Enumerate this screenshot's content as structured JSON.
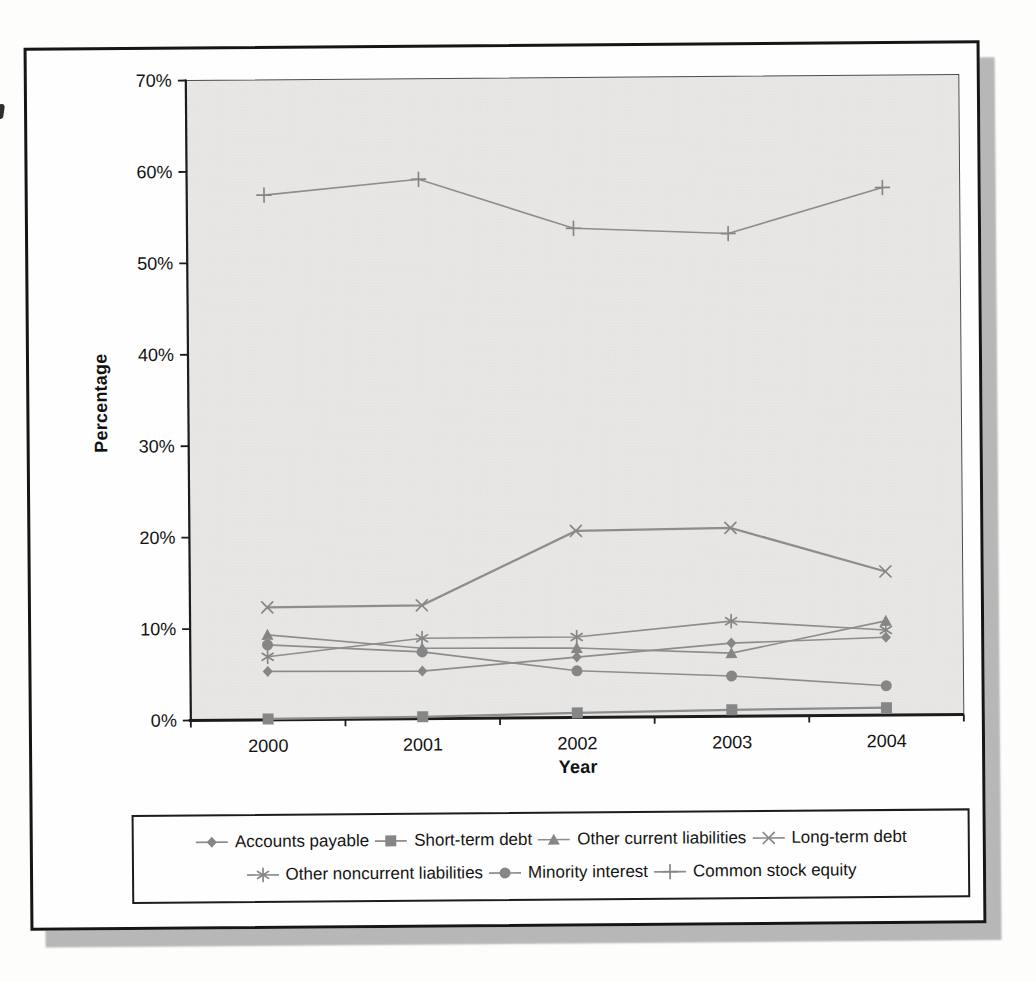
{
  "chart_data": {
    "type": "line",
    "title": "",
    "xlabel": "Year",
    "ylabel": "Percentage",
    "categories": [
      "2000",
      "2001",
      "2002",
      "2003",
      "2004"
    ],
    "ylim": [
      0,
      70
    ],
    "y_tick_step": 10,
    "y_tick_labels": [
      "0%",
      "10%",
      "20%",
      "30%",
      "40%",
      "50%",
      "60%",
      "70%"
    ],
    "grid": false,
    "legend_position": "bottom",
    "plot_fill_color": "#e8e7e5",
    "series_color": "#8d8d8d",
    "axis_color": "#1c1c1c",
    "series": [
      {
        "name": "Accounts payable",
        "marker": "diamond",
        "values": [
          5.3,
          5.2,
          6.6,
          8.0,
          8.5
        ]
      },
      {
        "name": "Short-term debt",
        "marker": "square",
        "values": [
          0.1,
          0.2,
          0.5,
          0.7,
          0.8
        ]
      },
      {
        "name": "Other current liabilities",
        "marker": "triangle",
        "values": [
          9.3,
          7.7,
          7.6,
          6.9,
          10.3
        ]
      },
      {
        "name": "Long-term debt",
        "marker": "x",
        "values": [
          12.3,
          12.4,
          20.4,
          20.6,
          15.7
        ]
      },
      {
        "name": "Other noncurrent liabilities",
        "marker": "asterisk",
        "values": [
          6.9,
          8.8,
          8.8,
          10.4,
          9.3
        ]
      },
      {
        "name": "Minority interest",
        "marker": "circle",
        "values": [
          8.2,
          7.3,
          5.1,
          4.4,
          3.2
        ]
      },
      {
        "name": "Common stock equity",
        "marker": "plus",
        "values": [
          57.4,
          59.0,
          53.5,
          52.8,
          57.7
        ]
      }
    ],
    "legend_rows": [
      [
        "Accounts payable",
        "Short-term debt",
        "Other current liabilities",
        "Long-term debt"
      ],
      [
        "Other noncurrent liabilities",
        "Minority interest",
        "Common stock equity"
      ]
    ]
  }
}
